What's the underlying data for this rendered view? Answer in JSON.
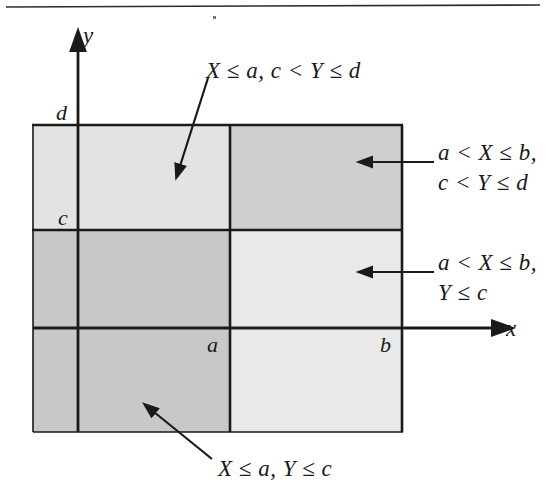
{
  "figure": {
    "kind": "math-diagram",
    "background_color": "#ffffff",
    "ink_color": "#1a1a1a",
    "top_rule": true
  },
  "axes": {
    "x_axis_label": "x",
    "y_axis_label": "y"
  },
  "ticks": {
    "x": [
      {
        "label": "a"
      },
      {
        "label": "b"
      }
    ],
    "y": [
      {
        "label": "c"
      },
      {
        "label": "d"
      }
    ]
  },
  "regions": [
    {
      "name": "upper-left",
      "label": "X ≤ a, c < Y ≤ d",
      "fill": "#e3e3e3"
    },
    {
      "name": "upper-right",
      "label": "a < X ≤ b,\nc < Y ≤ d",
      "fill": "#cfcfcf"
    },
    {
      "name": "lower-right",
      "label": "a < X ≤ b,\nY ≤ c",
      "fill": "#e9e9e9"
    },
    {
      "name": "lower-left",
      "label": "X ≤ a, Y ≤ c",
      "fill": "#c8c8c8"
    }
  ],
  "annotations": {
    "top_left": "X ≤ a, c < Y ≤ d",
    "right_upper": "a < X ≤ b,\nc < Y ≤ d",
    "right_lower": "a < X ≤ b,\nY ≤ c",
    "bottom": "X ≤ a, Y ≤ c"
  }
}
